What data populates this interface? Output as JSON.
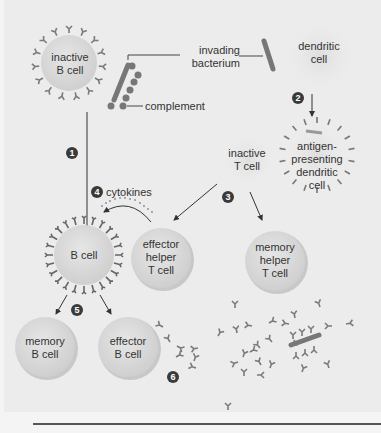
{
  "diagram": {
    "cells": {
      "inactive_b_cell": "inactive\nB cell",
      "dendritic_cell": "dendritic\ncell",
      "antigen_presenting_dendritic_cell": "antigen-\npresenting\ndendritic\ncell",
      "inactive_t_cell": "inactive\nT cell",
      "b_cell": "B cell",
      "effector_helper_t_cell": "effector\nhelper\nT cell",
      "memory_helper_t_cell": "memory\nhelper\nT cell",
      "memory_b_cell": "memory\nB cell",
      "effector_b_cell": "effector\nB cell"
    },
    "labels": {
      "invading_bacterium": "invading\nbacterium",
      "complement": "complement",
      "cytokines": "cytokines"
    },
    "steps": [
      "1",
      "2",
      "3",
      "4",
      "5",
      "6"
    ],
    "colors": {
      "background": "#ececec",
      "cell_fill": "#dcdcdc",
      "antibody": "#7a7a7a",
      "bacterium": "#777777",
      "step_badge": "#3a3a3a"
    }
  }
}
